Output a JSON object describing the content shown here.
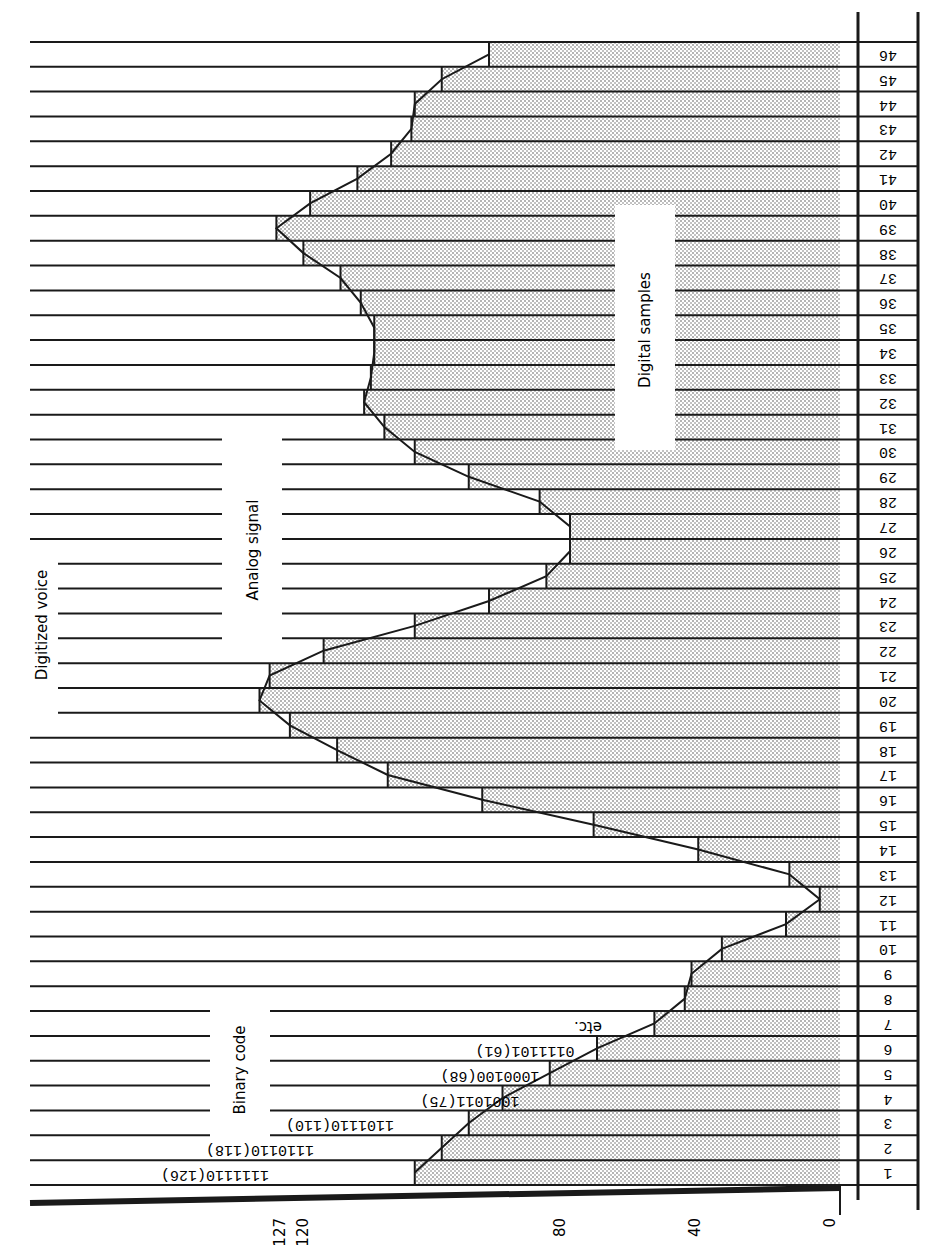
{
  "chart_data": {
    "type": "bar",
    "orientation": "rotated-90",
    "title": "Digitized voice",
    "annotations": [
      "Analog signal",
      "Digital samples",
      "Binary code",
      "etc."
    ],
    "xlabel": "Sample number",
    "ylabel": "Amplitude level",
    "ylim": [
      0,
      127
    ],
    "yticks": [
      0,
      40,
      80,
      120,
      127
    ],
    "categories": [
      1,
      2,
      3,
      4,
      5,
      6,
      7,
      8,
      9,
      10,
      11,
      12,
      13,
      14,
      15,
      16,
      17,
      18,
      19,
      20,
      21,
      22,
      23,
      24,
      25,
      26,
      27,
      28,
      29,
      30,
      31,
      32,
      33,
      34,
      35,
      36,
      37,
      38,
      39,
      40,
      41,
      42,
      43,
      44,
      45,
      46
    ],
    "values": [
      126,
      118,
      110,
      100,
      86,
      72,
      55,
      46,
      44,
      35,
      16,
      6,
      15,
      42,
      73,
      106,
      134,
      149,
      163,
      172,
      169,
      153,
      126,
      104,
      87,
      80,
      80,
      89,
      110,
      126,
      135,
      141,
      139,
      138,
      138,
      142,
      148,
      159,
      167,
      157,
      143,
      133,
      127,
      126,
      118,
      104
    ],
    "binary_codes": [
      {
        "sample": 1,
        "code": "1111110",
        "value": 126
      },
      {
        "sample": 2,
        "code": "1110110",
        "value": 118
      },
      {
        "sample": 3,
        "code": "1101110",
        "value": 110
      },
      {
        "sample": 4,
        "code": "1001011",
        "value": 75
      },
      {
        "sample": 5,
        "code": "1000100",
        "value": 68
      },
      {
        "sample": 6,
        "code": "0111101",
        "value": 61
      }
    ],
    "grid": true
  },
  "labels": {
    "digitized_voice": "Digitized voice",
    "analog_signal": "Analog signal",
    "digital_samples": "Digital samples",
    "binary_code": "Binary code",
    "etc": "etc."
  },
  "axis": {
    "ticks": [
      {
        "label": "0",
        "value": 0
      },
      {
        "label": "40",
        "value": 40
      },
      {
        "label": "80",
        "value": 80
      },
      {
        "label": "120",
        "value": 120
      },
      {
        "label": "127",
        "value": 127
      }
    ]
  },
  "colors": {
    "ink": "#1a1a1a",
    "dot": "#555555",
    "paper": "#ffffff"
  }
}
